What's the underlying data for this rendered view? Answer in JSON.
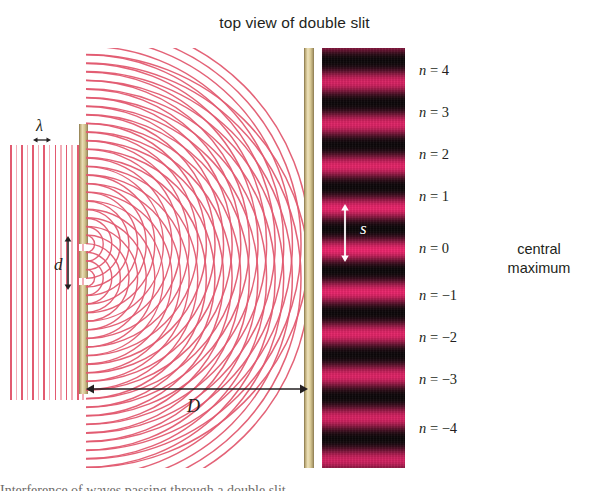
{
  "figure": {
    "title": "top view of double slit",
    "width": 589,
    "height": 491,
    "background": "#ffffff"
  },
  "colors": {
    "wave": "#e25a70",
    "wave_faint": "#f3aeb8",
    "barrier": "#d8c894",
    "fringe_bright": "#f0266e",
    "fringe_dark": "#0d0809",
    "text": "#231f20",
    "arrow": "#231f20",
    "s_label": "#ffffff"
  },
  "labels": {
    "wavelength": "λ",
    "slit_separation": "d",
    "fringe_spacing": "s",
    "screen_distance": "D",
    "central_maximum": "central maximum"
  },
  "orders": [
    {
      "text": "n = 4",
      "n": 4,
      "y": 72
    },
    {
      "text": "n = 3",
      "n": 3,
      "y": 114
    },
    {
      "text": "n = 2",
      "n": 2,
      "y": 156
    },
    {
      "text": "n = 1",
      "n": 1,
      "y": 198
    },
    {
      "text": "n = 0",
      "n": 0,
      "y": 250
    },
    {
      "text": "n = −1",
      "n": -1,
      "y": 297
    },
    {
      "text": "n = −2",
      "n": -2,
      "y": 339
    },
    {
      "text": "n = −3",
      "n": -3,
      "y": 381
    },
    {
      "text": "n = −4",
      "n": -4,
      "y": 430
    }
  ],
  "caption_remnant": "Interference of waves passing through a double slit.",
  "geometry": {
    "barrier_x": 79,
    "barrier_top": 124,
    "barrier_bottom": 394,
    "slit_upper_y": 244,
    "slit_lower_y": 278,
    "slit_gap": 7,
    "screen_x": 304,
    "fringe_panel_x": 322,
    "fringe_panel_width": 83,
    "fringe_top": 48,
    "fringe_bottom": 468,
    "fringe_spacing_px": 42,
    "plane_wave_count": 7,
    "arc_count": 26
  }
}
